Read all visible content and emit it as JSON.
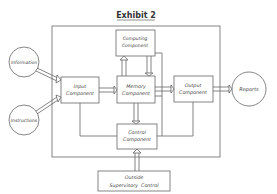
{
  "title": "Exhibit 2",
  "nodes": {
    "information": "Information",
    "instructions": "Instructions",
    "input": [
      "Input",
      "Component"
    ],
    "computing": [
      "Computing",
      "Component"
    ],
    "memory": [
      "Memory",
      "Component"
    ],
    "output": [
      "Output",
      "Component"
    ],
    "control": [
      "Control",
      "Component"
    ],
    "reports": "Reports",
    "supervisory": [
      "Outside",
      "Supervisory  Control"
    ]
  },
  "colors": {
    "line": "#555555",
    "background": "#ffffff"
  }
}
